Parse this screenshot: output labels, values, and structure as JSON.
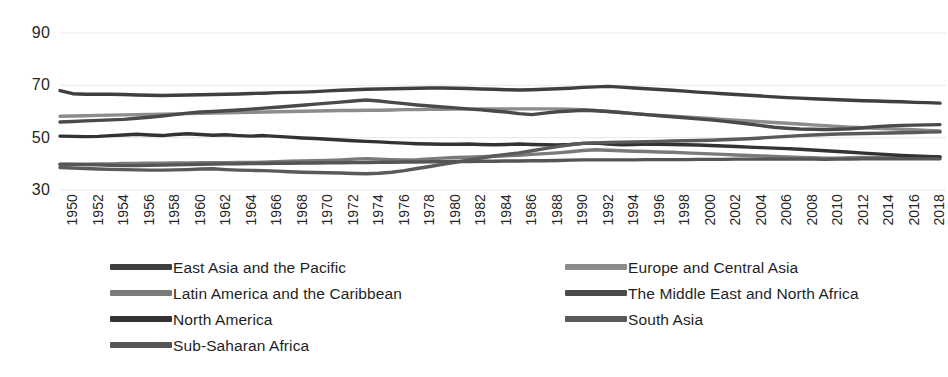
{
  "chart_data": {
    "type": "line",
    "title": "",
    "subtitle": "",
    "xlabel": "",
    "ylabel": "",
    "xlim": [
      1950,
      2019
    ],
    "ylim": [
      30,
      90
    ],
    "yticks": [
      30,
      50,
      70,
      90
    ],
    "ytick_labels": [
      "30",
      "50",
      "70",
      "90"
    ],
    "grid": true,
    "grid_axis": "y",
    "legend_position": "bottom",
    "legend_columns": 2,
    "x": [
      1950,
      1951,
      1952,
      1953,
      1954,
      1955,
      1956,
      1957,
      1958,
      1959,
      1960,
      1961,
      1962,
      1963,
      1964,
      1965,
      1966,
      1967,
      1968,
      1969,
      1970,
      1971,
      1972,
      1973,
      1974,
      1975,
      1976,
      1977,
      1978,
      1979,
      1980,
      1981,
      1982,
      1983,
      1984,
      1985,
      1986,
      1987,
      1988,
      1989,
      1990,
      1991,
      1992,
      1993,
      1994,
      1995,
      1996,
      1997,
      1998,
      1999,
      2000,
      2001,
      2002,
      2003,
      2004,
      2005,
      2006,
      2007,
      2008,
      2009,
      2010,
      2011,
      2012,
      2013,
      2014,
      2015,
      2016,
      2017,
      2018,
      2019
    ],
    "xtick_labels": [
      "1950",
      "1952",
      "1954",
      "1956",
      "1958",
      "1960",
      "1962",
      "1964",
      "1966",
      "1968",
      "1970",
      "1972",
      "1974",
      "1976",
      "1978",
      "1980",
      "1982",
      "1984",
      "1986",
      "1988",
      "1990",
      "1992",
      "1994",
      "1996",
      "1998",
      "2000",
      "2002",
      "2004",
      "2006",
      "2008",
      "2010",
      "2012",
      "2014",
      "2016",
      "2018"
    ],
    "series": [
      {
        "name": "East Asia and the Pacific",
        "color": "#3f3f3f",
        "values": [
          68.0,
          66.8,
          66.6,
          66.6,
          66.6,
          66.5,
          66.3,
          66.2,
          66.1,
          66.2,
          66.3,
          66.4,
          66.5,
          66.6,
          66.7,
          66.9,
          67.0,
          67.2,
          67.3,
          67.4,
          67.6,
          67.9,
          68.1,
          68.3,
          68.5,
          68.6,
          68.7,
          68.8,
          68.9,
          69.0,
          69.0,
          68.9,
          68.8,
          68.6,
          68.5,
          68.3,
          68.2,
          68.3,
          68.5,
          68.7,
          68.9,
          69.2,
          69.4,
          69.6,
          69.3,
          69.0,
          68.7,
          68.4,
          68.1,
          67.8,
          67.4,
          67.1,
          66.8,
          66.5,
          66.2,
          65.9,
          65.6,
          65.3,
          65.1,
          64.9,
          64.7,
          64.5,
          64.3,
          64.1,
          64.0,
          63.8,
          63.7,
          63.5,
          63.4,
          63.2
        ]
      },
      {
        "name": "Europe and Central Asia",
        "color": "#8c8c8c",
        "values": [
          58.2,
          58.3,
          58.4,
          58.5,
          58.6,
          58.7,
          58.8,
          58.9,
          59.0,
          59.1,
          59.2,
          59.3,
          59.4,
          59.5,
          59.6,
          59.7,
          59.8,
          59.9,
          60.0,
          60.1,
          60.2,
          60.3,
          60.4,
          60.4,
          60.5,
          60.5,
          60.6,
          60.7,
          60.7,
          60.8,
          60.8,
          60.9,
          60.9,
          61.0,
          61.0,
          61.0,
          61.0,
          61.0,
          61.0,
          61.0,
          60.9,
          60.7,
          60.4,
          60.0,
          59.6,
          59.2,
          58.8,
          58.5,
          58.2,
          57.9,
          57.6,
          57.3,
          57.0,
          56.7,
          56.4,
          56.1,
          55.8,
          55.5,
          55.2,
          54.9,
          54.6,
          54.3,
          54.0,
          53.8,
          53.6,
          53.4,
          53.2,
          53.0,
          52.8,
          52.6
        ]
      },
      {
        "name": "Latin America and the Caribbean",
        "color": "#7a7a7a",
        "values": [
          39.8,
          39.9,
          39.9,
          40.0,
          40.0,
          40.1,
          40.1,
          40.2,
          40.2,
          40.3,
          40.3,
          40.4,
          40.4,
          40.4,
          40.5,
          40.5,
          40.6,
          40.8,
          41.0,
          41.1,
          41.2,
          41.3,
          41.5,
          41.8,
          42.0,
          41.8,
          41.6,
          41.5,
          41.6,
          41.9,
          42.2,
          42.4,
          42.5,
          42.7,
          42.9,
          43.1,
          43.3,
          43.6,
          43.9,
          44.2,
          44.6,
          45.1,
          45.4,
          45.2,
          45.0,
          44.8,
          44.7,
          44.5,
          44.4,
          44.2,
          44.0,
          43.8,
          43.6,
          43.4,
          43.2,
          43.0,
          42.8,
          42.6,
          42.4,
          42.3,
          42.2,
          42.2,
          42.3,
          42.4,
          42.4,
          42.5,
          42.5,
          42.6,
          42.6,
          42.7
        ]
      },
      {
        "name": "The Middle East and North Africa",
        "color": "#4a4a4a",
        "values": [
          56.0,
          56.2,
          56.4,
          56.6,
          56.8,
          57.0,
          57.4,
          57.8,
          58.3,
          58.8,
          59.4,
          59.8,
          60.0,
          60.3,
          60.6,
          60.9,
          61.3,
          61.6,
          62.0,
          62.4,
          62.8,
          63.2,
          63.6,
          64.0,
          64.4,
          64.0,
          63.5,
          63.0,
          62.5,
          62.1,
          61.7,
          61.4,
          61.0,
          60.6,
          60.2,
          59.8,
          59.2,
          58.8,
          59.4,
          59.9,
          60.2,
          60.5,
          60.3,
          60.0,
          59.6,
          59.2,
          58.8,
          58.4,
          58.0,
          57.6,
          57.2,
          56.8,
          56.3,
          55.8,
          55.2,
          54.6,
          54.0,
          53.6,
          53.3,
          53.2,
          53.1,
          53.2,
          53.4,
          53.8,
          54.2,
          54.5,
          54.7,
          54.8,
          54.9,
          55.0
        ]
      },
      {
        "name": "North America",
        "color": "#333333",
        "values": [
          50.6,
          50.5,
          50.4,
          50.5,
          50.8,
          51.0,
          51.3,
          51.0,
          50.8,
          51.2,
          51.5,
          51.2,
          50.9,
          51.1,
          50.8,
          50.6,
          50.8,
          50.5,
          50.2,
          49.9,
          49.7,
          49.4,
          49.1,
          48.8,
          48.6,
          48.4,
          48.1,
          47.9,
          47.7,
          47.6,
          47.5,
          47.5,
          47.6,
          47.4,
          47.3,
          47.4,
          47.6,
          47.4,
          47.3,
          47.2,
          47.4,
          47.8,
          47.9,
          47.6,
          47.3,
          47.4,
          47.6,
          47.5,
          47.4,
          47.3,
          47.2,
          47.0,
          46.8,
          46.6,
          46.4,
          46.2,
          46.0,
          45.8,
          45.6,
          45.3,
          45.0,
          44.7,
          44.4,
          44.1,
          43.8,
          43.5,
          43.2,
          43.0,
          42.8,
          42.6
        ]
      },
      {
        "name": "South Asia",
        "color": "#5a5a5a",
        "values": [
          38.6,
          38.4,
          38.2,
          38.0,
          37.9,
          37.8,
          37.7,
          37.6,
          37.6,
          37.7,
          37.8,
          38.0,
          38.1,
          37.8,
          37.6,
          37.5,
          37.4,
          37.2,
          37.0,
          36.8,
          36.7,
          36.6,
          36.5,
          36.3,
          36.2,
          36.4,
          36.8,
          37.4,
          38.2,
          39.0,
          39.8,
          40.6,
          41.4,
          42.2,
          43.0,
          43.6,
          44.2,
          45.0,
          45.8,
          46.6,
          47.3,
          47.8,
          48.0,
          48.2,
          48.3,
          48.4,
          48.5,
          48.6,
          48.7,
          48.8,
          48.9,
          49.0,
          49.2,
          49.4,
          49.6,
          49.9,
          50.2,
          50.5,
          50.8,
          51.0,
          51.2,
          51.4,
          51.5,
          51.6,
          51.7,
          51.8,
          51.9,
          52.0,
          52.1,
          52.2
        ]
      },
      {
        "name": "Sub-Saharan Africa",
        "color": "#555555",
        "values": [
          39.9,
          39.8,
          39.7,
          39.6,
          39.4,
          39.3,
          39.3,
          39.4,
          39.5,
          39.6,
          39.7,
          39.8,
          39.9,
          40.0,
          40.0,
          40.1,
          40.1,
          40.2,
          40.2,
          40.3,
          40.3,
          40.4,
          40.4,
          40.5,
          40.5,
          40.6,
          40.6,
          40.7,
          40.7,
          40.8,
          40.8,
          40.9,
          40.9,
          41.0,
          41.0,
          41.1,
          41.1,
          41.2,
          41.2,
          41.3,
          41.4,
          41.5,
          41.5,
          41.5,
          41.5,
          41.5,
          41.6,
          41.6,
          41.6,
          41.6,
          41.7,
          41.7,
          41.7,
          41.8,
          41.8,
          41.8,
          41.8,
          41.8,
          41.8,
          41.8,
          41.7,
          41.8,
          41.8,
          41.9,
          41.9,
          41.9,
          41.9,
          41.9,
          41.9,
          41.9
        ]
      }
    ],
    "legend_entries": [
      {
        "label": "East Asia and the Pacific",
        "color": "#3f3f3f"
      },
      {
        "label": "Europe and Central Asia",
        "color": "#8c8c8c"
      },
      {
        "label": "Latin America and the Caribbean",
        "color": "#7a7a7a"
      },
      {
        "label": "The Middle East and North Africa",
        "color": "#4a4a4a"
      },
      {
        "label": "North America",
        "color": "#333333"
      },
      {
        "label": "South Asia",
        "color": "#5a5a5a"
      },
      {
        "label": "Sub-Saharan Africa",
        "color": "#555555"
      }
    ]
  },
  "style": {
    "gridline_color": "#e8e8e8",
    "axis_text_color": "#262626",
    "background": "#ffffff"
  }
}
